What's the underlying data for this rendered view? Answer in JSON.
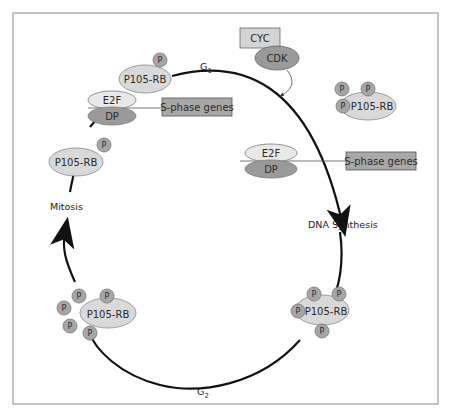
{
  "diagram": {
    "phases": {
      "g1": {
        "label": "G",
        "subscript": "1"
      },
      "g2": {
        "label": "G",
        "subscript": "2"
      },
      "dna_synthesis": "DNA Synthesis",
      "mitosis": "Mitosis"
    },
    "labels": {
      "rb": "P105-RB",
      "phosphate": "P",
      "e2f": "E2F",
      "dp": "DP",
      "s_phase_genes": "S-phase genes",
      "cyc": "CYC",
      "cdk": "CDK"
    },
    "colors": {
      "rb_fill": "#d9d9d9",
      "phosphate_fill": "#a6a6a6",
      "e2f_fill": "#e8e8e8",
      "dp_fill": "#9a9a9a",
      "cdk_fill": "#9a9a9a",
      "cyc_fill": "#d4d4d4",
      "gene_box_fill": "#a8a8a8",
      "cycle_stroke": "#111111",
      "frame_stroke": "#8a8a8a"
    }
  }
}
